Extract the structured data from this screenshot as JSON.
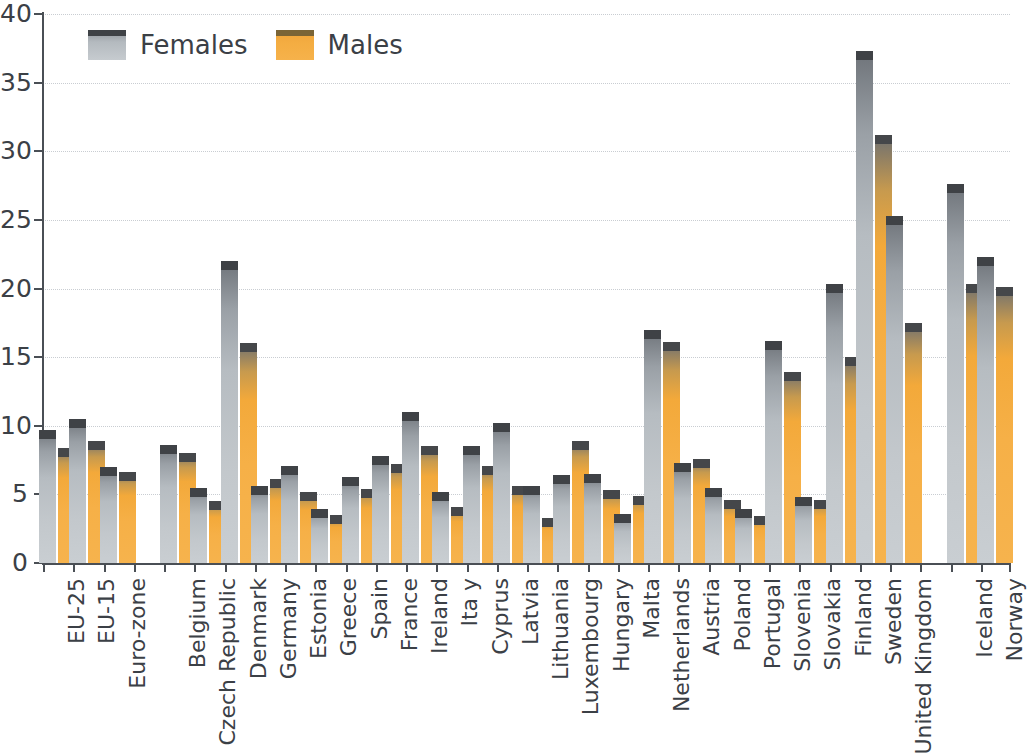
{
  "legend": {
    "position": "top-left",
    "entries": [
      {
        "label": "Females",
        "color": "#c0c5ca",
        "swatch": "female"
      },
      {
        "label": "Males",
        "color": "#f4ab3f",
        "swatch": "male"
      }
    ]
  },
  "axes": {
    "y_ticks": [
      "0",
      "5",
      "10",
      "15",
      "20",
      "25",
      "30",
      "35",
      "40"
    ],
    "x_axis_label": "",
    "y_axis_label": ""
  },
  "chart_data": {
    "type": "bar",
    "title": "",
    "subtitle": "",
    "xlabel": "",
    "ylabel": "",
    "ylim": [
      0,
      40
    ],
    "ytick_step": 5,
    "grid": "horizontal-dotted",
    "legend_position": "top-left",
    "orientation": "vertical",
    "grouping": "grouped",
    "categories": [
      "EU-25",
      "EU-15",
      "Euro-zone",
      "Belgium",
      "Czech Republic",
      "Denmark",
      "Germany",
      "Estonia",
      "Greece",
      "Spain",
      "France",
      "Ireland",
      "Ita y",
      "Cyprus",
      "Latvia",
      "Lithuania",
      "Luxembourg",
      "Hungary",
      "Malta",
      "Netherlands",
      "Austria",
      "Poland",
      "Portugal",
      "Slovenia",
      "Slovakia",
      "Finland",
      "Sweden",
      "United Kingdom",
      "Iceland",
      "Norway"
    ],
    "gaps_after": [
      "Euro-zone",
      "United Kingdom"
    ],
    "series": [
      {
        "name": "Females",
        "color": "#c0c5ca",
        "values": [
          9.7,
          10.5,
          7.0,
          8.6,
          5.5,
          22.0,
          5.6,
          7.1,
          3.9,
          6.3,
          7.8,
          11.0,
          5.2,
          8.5,
          10.2,
          5.6,
          6.4,
          6.5,
          3.6,
          17.0,
          7.3,
          5.5,
          3.9,
          16.2,
          4.8,
          20.3,
          37.3,
          25.3,
          27.6,
          22.3
        ]
      },
      {
        "name": "Males",
        "color": "#f4ab3f",
        "values": [
          8.4,
          8.9,
          6.6,
          8.0,
          4.5,
          16.0,
          6.1,
          5.2,
          3.5,
          5.4,
          7.2,
          8.5,
          4.1,
          7.1,
          5.6,
          3.3,
          8.9,
          5.3,
          4.9,
          16.1,
          7.6,
          4.6,
          3.4,
          13.9,
          4.6,
          15.0,
          31.2,
          17.5,
          20.3,
          20.1
        ]
      }
    ]
  }
}
